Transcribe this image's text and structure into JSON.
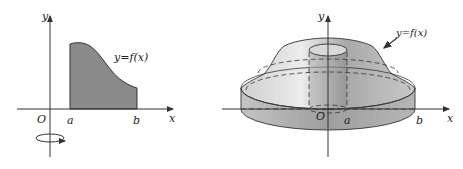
{
  "figure_left": {
    "title": "region under curve",
    "labels": {
      "y_axis": "y",
      "x_axis": "x",
      "origin": "O",
      "a": "a",
      "b": "b",
      "curve": "y=f(x)"
    },
    "colors": {
      "fill": "#8a8a8a",
      "axis": "#333333"
    }
  },
  "figure_right": {
    "title": "solid of revolution about y-axis",
    "labels": {
      "y_axis": "y",
      "x_axis": "x",
      "origin": "O",
      "a": "a",
      "b": "b",
      "curve": "y=f(x)"
    },
    "colors": {
      "solid": "#b8b8b8",
      "axis": "#333333"
    }
  }
}
